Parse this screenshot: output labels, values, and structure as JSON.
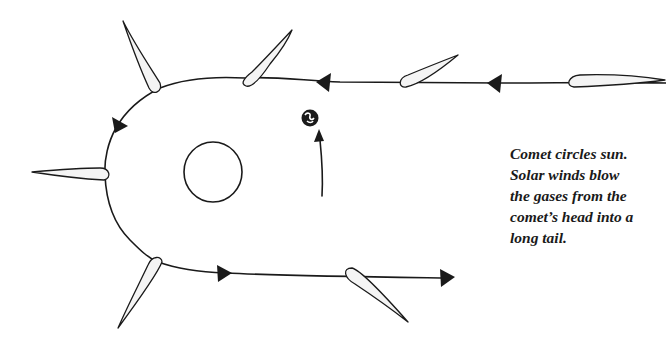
{
  "caption": {
    "lines": [
      "Comet circles sun.",
      "Solar winds blow",
      "the gases from the",
      "comet’s head into a",
      "long tail."
    ]
  },
  "elements": {
    "sun": "sun-circle",
    "earth": "earth-icon",
    "orbit": "comet-orbit-path",
    "comets_count": 7,
    "direction_arrows_count": 5
  },
  "colors": {
    "ink": "#1a1a1a",
    "background": "#ffffff",
    "comet_fill": "#f4f4f4"
  }
}
